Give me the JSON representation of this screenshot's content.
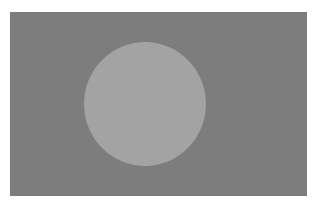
{
  "image": {
    "description": "Grayscale flag: dark gray rectangle with a lighter gray circle left of center",
    "colors": {
      "background": "#ffffff",
      "field": "#7d7d7d",
      "disc": "#a3a3a3"
    }
  }
}
